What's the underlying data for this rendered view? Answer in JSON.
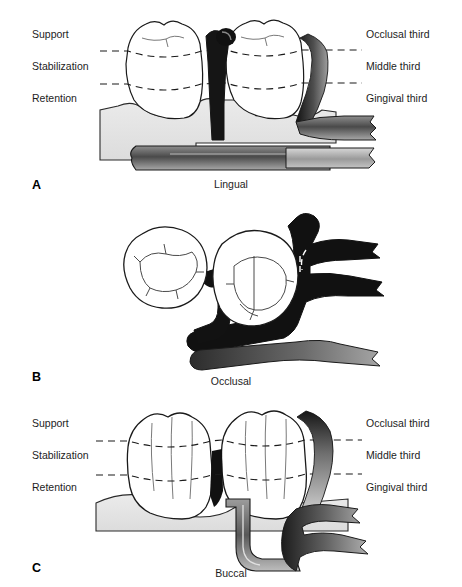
{
  "figure": {
    "background_color": "#ffffff",
    "ink_color": "#1a1a1a",
    "tissue_color": "#e3e3e3",
    "metal_dark": "#1b1b1b",
    "metal_mid": "#6e6e6e",
    "metal_light": "#c9c9c9"
  },
  "left_labels": [
    {
      "id": "support",
      "text": "Support"
    },
    {
      "id": "stabilization",
      "text": "Stabilization"
    },
    {
      "id": "retention",
      "text": "Retention"
    }
  ],
  "right_labels": [
    {
      "id": "occlusal-third",
      "text": "Occlusal third"
    },
    {
      "id": "middle-third",
      "text": "Middle third"
    },
    {
      "id": "gingival-third",
      "text": "Gingival third"
    }
  ],
  "panels": [
    {
      "key": "a",
      "letter": "A",
      "caption": "Lingual",
      "has_side_labels": true
    },
    {
      "key": "b",
      "letter": "B",
      "caption": "Occlusal",
      "has_side_labels": false
    },
    {
      "key": "c",
      "letter": "C",
      "caption": "Buccal",
      "has_side_labels": true
    }
  ],
  "footnote": {
    "text": ""
  }
}
